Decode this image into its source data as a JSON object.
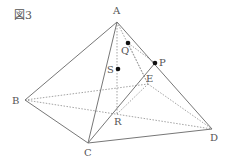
{
  "figure": {
    "title": "図3",
    "vertices": {
      "A": {
        "label": "A",
        "x": 117,
        "y": 22,
        "lx": 113,
        "ly": 14
      },
      "B": {
        "label": "B",
        "x": 25,
        "y": 100,
        "lx": 12,
        "ly": 104
      },
      "C": {
        "label": "C",
        "x": 88,
        "y": 143,
        "lx": 84,
        "ly": 156
      },
      "D": {
        "label": "D",
        "x": 212,
        "y": 129,
        "lx": 210,
        "ly": 141
      },
      "E": {
        "label": "E",
        "x": 148,
        "y": 84,
        "lx": 147,
        "ly": 82
      }
    },
    "points": {
      "P": {
        "label": "P",
        "x": 155,
        "y": 63,
        "lx": 159,
        "ly": 66
      },
      "Q": {
        "label": "Q",
        "x": 128,
        "y": 43,
        "lx": 121,
        "ly": 54
      },
      "S": {
        "label": "S",
        "x": 118,
        "y": 69,
        "lx": 107,
        "ly": 73
      },
      "R": {
        "label": "R",
        "x": 117,
        "y": 114,
        "lx": 115,
        "ly": 125
      }
    },
    "solid_edges": [
      [
        "A",
        "B"
      ],
      [
        "A",
        "C"
      ],
      [
        "A",
        "D"
      ],
      [
        "B",
        "C"
      ],
      [
        "C",
        "D"
      ],
      [
        "P",
        "C"
      ]
    ],
    "dotted_edges": [
      [
        "A",
        "E"
      ],
      [
        "B",
        "E"
      ],
      [
        "E",
        "D"
      ],
      [
        "B",
        "D"
      ],
      [
        "A",
        "R"
      ],
      [
        "Q",
        "E"
      ]
    ]
  }
}
